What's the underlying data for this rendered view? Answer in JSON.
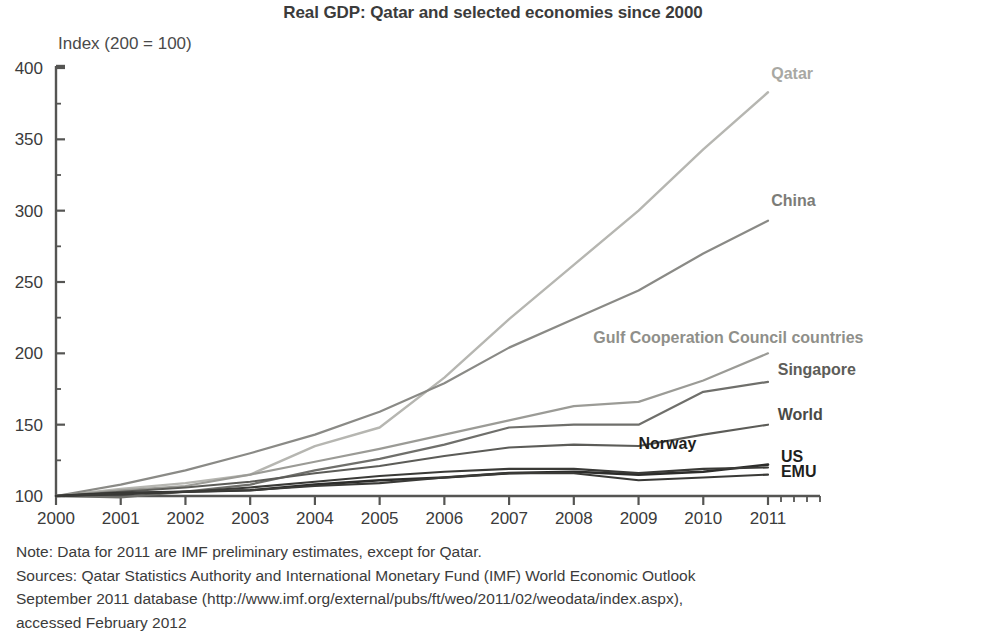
{
  "chart_data": {
    "type": "line",
    "title": "Real GDP: Qatar and selected economies since 2000",
    "ylabel": "Index (200 = 100)",
    "xlabel": "",
    "grid": false,
    "legend_position": "right-inline-labels",
    "xlim": [
      2000,
      2011
    ],
    "ylim": [
      100,
      400
    ],
    "ytick_step": 50,
    "x": [
      2000,
      2001,
      2002,
      2003,
      2004,
      2005,
      2006,
      2007,
      2008,
      2009,
      2010,
      2011
    ],
    "categories": [
      "2000",
      "2001",
      "2002",
      "2003",
      "2004",
      "2005",
      "2006",
      "2007",
      "2008",
      "2009",
      "2010",
      "2011"
    ],
    "ytick_labels": [
      "100",
      "150",
      "200",
      "250",
      "300",
      "350",
      "400"
    ],
    "ytick_values": [
      100,
      150,
      200,
      250,
      300,
      350,
      400
    ],
    "series": [
      {
        "name": "Qatar",
        "color": "#b6b6b1",
        "width": 2.4,
        "label_color": "#a8a8a3",
        "values": [
          100,
          105,
          109,
          115,
          135,
          148,
          183,
          224,
          262,
          300,
          343,
          383
        ]
      },
      {
        "name": "China",
        "color": "#8a8a86",
        "width": 2.2,
        "label_color": "#7c7c78",
        "values": [
          100,
          108,
          118,
          130,
          143,
          159,
          179,
          204,
          224,
          244,
          270,
          293
        ]
      },
      {
        "name": "Gulf Cooperation Council countries",
        "color": "#9b9b96",
        "width": 2.2,
        "label_color": "#8f8f8a",
        "values": [
          100,
          104,
          107,
          115,
          124,
          133,
          143,
          153,
          163,
          166,
          181,
          200
        ]
      },
      {
        "name": "Singapore",
        "color": "#6f6f6b",
        "width": 2.2,
        "label_color": "#5d5d59",
        "values": [
          100,
          99,
          103,
          108,
          118,
          126,
          136,
          148,
          150,
          150,
          173,
          180
        ]
      },
      {
        "name": "World",
        "color": "#5c5c58",
        "width": 2.1,
        "label_color": "#4a4a46",
        "values": [
          100,
          103,
          106,
          110,
          116,
          121,
          128,
          134,
          136,
          135,
          143,
          150
        ]
      },
      {
        "name": "Norway",
        "color": "#2d2d2b",
        "width": 2.6,
        "label_color": "#1f1f1d",
        "values": [
          100,
          102,
          103,
          104,
          108,
          111,
          113,
          116,
          117,
          115,
          117,
          122
        ]
      },
      {
        "name": "US",
        "color": "#3a3a37",
        "width": 2.1,
        "label_color": "#1f1f1d",
        "values": [
          100,
          101,
          103,
          106,
          110,
          114,
          117,
          119,
          119,
          116,
          119,
          120
        ]
      },
      {
        "name": "EMU",
        "color": "#3a3a37",
        "width": 2.1,
        "label_color": "#1f1f1d",
        "values": [
          100,
          102,
          103,
          104,
          107,
          109,
          113,
          116,
          116,
          111,
          113,
          115
        ]
      }
    ],
    "annotations": [
      {
        "text": "Qatar",
        "x": 2011.05,
        "y": 392
      },
      {
        "text": "China",
        "x": 2011.05,
        "y": 303
      },
      {
        "text": "Gulf Cooperation Council countries",
        "x": 2008.3,
        "y": 207
      },
      {
        "text": "Singapore",
        "x": 2011.15,
        "y": 185
      },
      {
        "text": "World",
        "x": 2011.15,
        "y": 153
      },
      {
        "text": "Norway",
        "x": 2009.0,
        "y": 133
      },
      {
        "text": "US",
        "x": 2011.2,
        "y": 124
      },
      {
        "text": "EMU",
        "x": 2011.2,
        "y": 113
      }
    ]
  },
  "footnotes": {
    "note": "Note: Data for 2011 are IMF preliminary estimates, except for Qatar.",
    "sources_line1": "Sources: Qatar Statistics Authority and International Monetary Fund (IMF) World Economic Outlook",
    "sources_line2": "September 2011 database (http://www.imf.org/external/pubs/ft/weo/2011/02/weodata/index.aspx),",
    "sources_line3": "accessed February 2012"
  }
}
